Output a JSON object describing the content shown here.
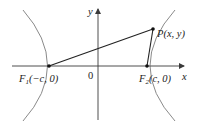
{
  "diagram": {
    "type": "hyperbola-foci",
    "axes": {
      "x_label": "x",
      "y_label": "y",
      "origin_label": "0"
    },
    "points": {
      "F1": {
        "name": "F",
        "subscript": "1",
        "coords": "(−c, 0)"
      },
      "F2": {
        "name": "F",
        "subscript": "2",
        "coords": "(c, 0)"
      },
      "P": {
        "name": "P",
        "coords": "(x, y)"
      }
    },
    "segments": [
      "F1P",
      "F2P"
    ],
    "colors": {
      "curve": "#8a8a8a",
      "axis": "#3a3a3a",
      "segment": "#222222",
      "point": "#111111"
    }
  }
}
